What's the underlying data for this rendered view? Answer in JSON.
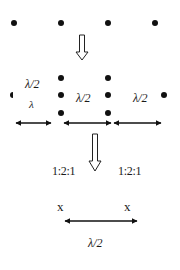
{
  "diagram": {
    "type": "lattice-transformation",
    "colors": {
      "ink": "#111111",
      "background": "#ffffff"
    },
    "stage1": {
      "description": "row of evenly spaced dots",
      "dots": [
        [
          14,
          23
        ],
        [
          61,
          23
        ],
        [
          108,
          23
        ],
        [
          155,
          23
        ]
      ]
    },
    "arrow1": {
      "icon": "hollow-down-arrow",
      "x": 82,
      "y1": 35,
      "y2": 61
    },
    "stage2": {
      "dots": [
        [
          13,
          95
        ],
        [
          61,
          78
        ],
        [
          61,
          95
        ],
        [
          61,
          113
        ],
        [
          108,
          78
        ],
        [
          108,
          95
        ],
        [
          108,
          113
        ],
        [
          164,
          95
        ]
      ],
      "labels": [
        {
          "text": "λ/2",
          "x": 25,
          "y": 78
        },
        {
          "text": "λ",
          "x": 29,
          "y": 99
        },
        {
          "text": "λ/2",
          "x": 76,
          "y": 94
        },
        {
          "text": "λ/2",
          "x": 133,
          "y": 94
        }
      ],
      "double_arrows": [
        {
          "x1": 15,
          "x2": 52,
          "y": 123
        },
        {
          "x1": 63,
          "x2": 112,
          "y": 123
        },
        {
          "x1": 113,
          "x2": 162,
          "y": 123
        }
      ]
    },
    "arrow2": {
      "icon": "hollow-down-arrow",
      "x": 95,
      "y1": 134,
      "y2": 171
    },
    "stage3": {
      "ratio_labels": [
        {
          "text": "1:2:1",
          "x": 52,
          "y": 166
        },
        {
          "text": "1:2:1",
          "x": 118,
          "y": 166
        }
      ]
    },
    "stage4": {
      "x_labels": [
        {
          "text": "x",
          "x": 57,
          "y": 200
        },
        {
          "text": "x",
          "x": 124,
          "y": 200
        }
      ],
      "double_arrow": {
        "x1": 64,
        "x2": 138,
        "y": 221
      },
      "distance_label": {
        "text": "λ/2",
        "x": 88,
        "y": 237
      }
    }
  }
}
